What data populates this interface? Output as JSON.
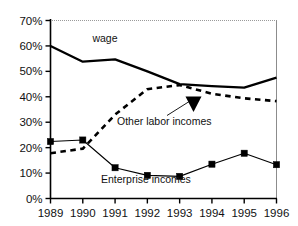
{
  "chart_data": {
    "type": "line",
    "title": "",
    "subtitle": "",
    "xlabel": "",
    "ylabel": "",
    "categories": [
      "1989",
      "1990",
      "1991",
      "1992",
      "1993",
      "1994",
      "1995",
      "1996"
    ],
    "x": [
      1989,
      1990,
      1991,
      1992,
      1993,
      1994,
      1995,
      1996
    ],
    "xlim": [
      1989,
      1996
    ],
    "ylim": [
      0,
      70
    ],
    "y_tick_labels": [
      "0%",
      "10%",
      "20%",
      "30%",
      "40%",
      "50%",
      "60%",
      "70%"
    ],
    "y_ticks": [
      0,
      10,
      20,
      30,
      40,
      50,
      60,
      70
    ],
    "grid": false,
    "legend_position": "inline-annotations",
    "series": [
      {
        "name": "wage",
        "style": "solid-thick",
        "color": "#000000",
        "markers": "none",
        "values": [
          60.0,
          53.8,
          54.7,
          50.0,
          45.0,
          44.2,
          43.6,
          47.5
        ]
      },
      {
        "name": "Other labor incomes",
        "style": "dashed",
        "color": "#000000",
        "markers": "none",
        "values": [
          17.8,
          19.6,
          33.0,
          43.0,
          44.6,
          41.2,
          39.4,
          38.3
        ]
      },
      {
        "name": "Enterprise incomes",
        "style": "solid-thin",
        "color": "#000000",
        "markers": "square",
        "values": [
          22.4,
          23.0,
          12.1,
          9.1,
          8.7,
          13.5,
          17.8,
          13.3
        ]
      }
    ],
    "annotations": [
      {
        "text": "wage",
        "series": "wage"
      },
      {
        "text": "Other labor incomes",
        "series": "Other labor incomes",
        "has_arrow": true
      },
      {
        "text": "Enterprise incomes",
        "series": "Enterprise incomes"
      }
    ]
  }
}
